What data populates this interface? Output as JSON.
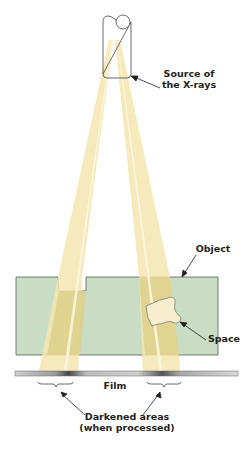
{
  "diagram": {
    "labels": {
      "source_line1": "Source of",
      "source_line2": "the X-rays",
      "object": "Object",
      "space": "Space",
      "film": "Film",
      "darkened_line1": "Darkened areas",
      "darkened_line2": "(when processed)"
    },
    "colors": {
      "beam": "#f5e6b0",
      "beam_core": "#fbf5dd",
      "beam_in_object": "#ddd08a",
      "object_fill": "#c9dcc4",
      "object_stroke": "#5a5a5a",
      "film_light": "#d8d8d8",
      "film_dark": "#555555",
      "tube_stroke": "#444444",
      "text": "#231f20"
    }
  }
}
